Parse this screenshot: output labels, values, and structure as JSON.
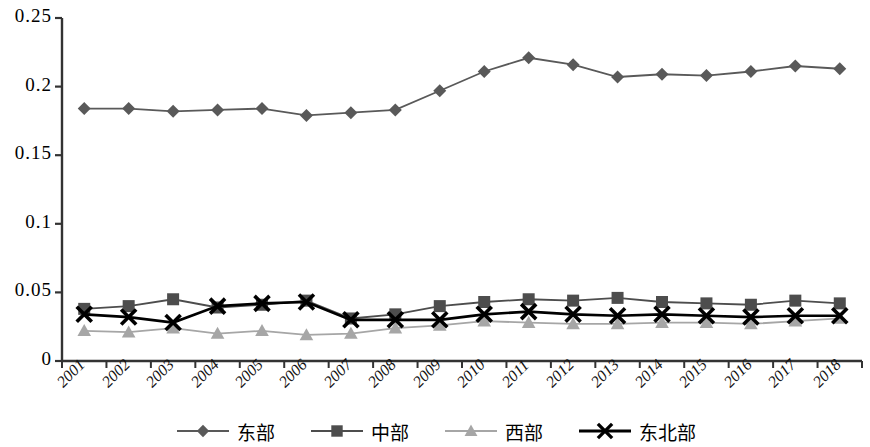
{
  "chart_data": {
    "type": "line",
    "title": "",
    "subtitle": "",
    "xlabel": "",
    "ylabel": "",
    "categories": [
      "2001",
      "2002",
      "2003",
      "2004",
      "2005",
      "2006",
      "2007",
      "2008",
      "2009",
      "2010",
      "2011",
      "2012",
      "2013",
      "2014",
      "2015",
      "2016",
      "2017",
      "2018"
    ],
    "ylim": [
      0,
      0.25
    ],
    "xlim_note": "categorical years 2001-2018",
    "ytick_labels": [
      "0",
      "0.05",
      "0.1",
      "0.15",
      "0.2",
      "0.25"
    ],
    "ytick_values": [
      0,
      0.05,
      0.1,
      0.15,
      0.2,
      0.25
    ],
    "grid": false,
    "legend_position": "bottom",
    "series": [
      {
        "name": "东部",
        "marker": "diamond",
        "color": "#595959",
        "values": [
          0.184,
          0.184,
          0.182,
          0.183,
          0.184,
          0.179,
          0.181,
          0.183,
          0.197,
          0.211,
          0.221,
          0.216,
          0.207,
          0.209,
          0.208,
          0.211,
          0.215,
          0.213
        ]
      },
      {
        "name": "中部",
        "marker": "square",
        "color": "#4d4d4d",
        "values": [
          0.038,
          0.04,
          0.045,
          0.039,
          0.041,
          0.044,
          0.031,
          0.034,
          0.04,
          0.043,
          0.045,
          0.044,
          0.046,
          0.043,
          0.042,
          0.041,
          0.044,
          0.042
        ]
      },
      {
        "name": "西部",
        "marker": "triangle",
        "color": "#a6a6a6",
        "values": [
          0.022,
          0.021,
          0.024,
          0.02,
          0.022,
          0.019,
          0.02,
          0.024,
          0.026,
          0.029,
          0.028,
          0.027,
          0.027,
          0.028,
          0.028,
          0.027,
          0.029,
          0.031
        ]
      },
      {
        "name": "东北部",
        "marker": "cross-x",
        "color": "#000000",
        "values": [
          0.034,
          0.032,
          0.028,
          0.04,
          0.042,
          0.043,
          0.03,
          0.03,
          0.03,
          0.034,
          0.036,
          0.034,
          0.033,
          0.034,
          0.033,
          0.032,
          0.033,
          0.033
        ]
      }
    ]
  },
  "axis": {
    "axis_color": "#333333",
    "y_axis_name": "y-axis",
    "x_axis_name": "x-axis"
  }
}
